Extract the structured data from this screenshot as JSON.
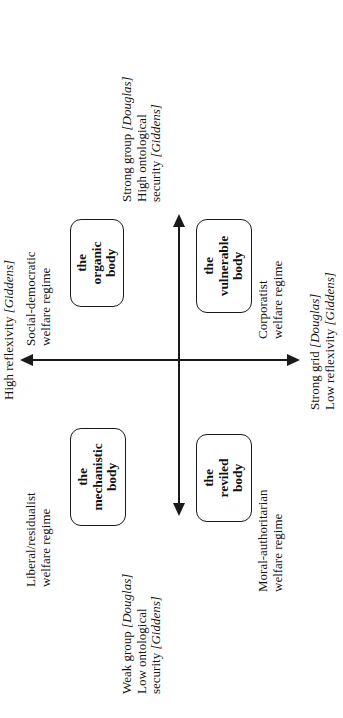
{
  "figure": {
    "type": "grid-group-typology",
    "orientation": "rotated-90-ccw",
    "axes": {
      "vertical": {
        "name": "grid / reflexivity axis",
        "top_label": {
          "line1": "High reflexivity",
          "line1_italic": "[Giddens]"
        },
        "bottom_label": {
          "line1": "Strong grid",
          "line1_italic": "[Douglas]",
          "line2": "Low reflexivity",
          "line2_italic": "[Giddens]"
        }
      },
      "horizontal": {
        "name": "group / ontological security axis",
        "positive_label": {
          "line1": "Strong group",
          "line1_italic": "[Douglas]",
          "line2": "High ontological",
          "line3": "security",
          "line3_italic": "[Giddens]"
        },
        "negative_label": {
          "line1": "Weak group",
          "line1_italic": "[Douglas]",
          "line2": "Low ontological",
          "line3": "security",
          "line3_italic": "[Giddens]"
        }
      }
    },
    "quadrants": [
      {
        "id": "organic",
        "box_line1": "the",
        "box_line2": "organic",
        "box_line3": "body",
        "regime_line1": "Social-democratic",
        "regime_line2": "welfare regime"
      },
      {
        "id": "vulnerable",
        "box_line1": "the",
        "box_line2": "vulnerable",
        "box_line3": "body",
        "regime_line1": "Corporatist",
        "regime_line2": "welfare regime"
      },
      {
        "id": "mechanistic",
        "box_line1": "the",
        "box_line2": "mechanistic",
        "box_line3": "body",
        "regime_line1": "Liberal/residualist",
        "regime_line2": "welfare regime"
      },
      {
        "id": "reviled",
        "box_line1": "the",
        "box_line2": "reviled",
        "box_line3": "body",
        "regime_line1": "Moral-authoritarian",
        "regime_line2": "welfare regime"
      }
    ],
    "colors": {
      "background": "#ffffff",
      "ink": "#1a1a1a"
    }
  }
}
